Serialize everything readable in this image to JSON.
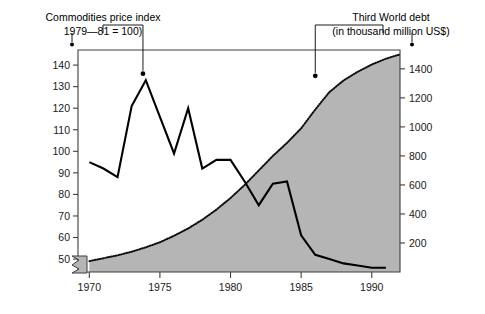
{
  "labels": {
    "left_caption_line1": "Commodities price index",
    "left_caption_line2": "1979—81 = 100)",
    "right_caption_line1": "Third World debt",
    "right_caption_line2": "(in thousand million US$)"
  },
  "chart_data": {
    "type": "line",
    "title": "",
    "xlabel": "",
    "ylabel": "Commodities price index (1979—81 = 100)",
    "y2label": "Third World debt (in thousand million US$)",
    "xlim": [
      1969.2,
      1992.0
    ],
    "ylim": [
      44,
      147
    ],
    "y2lim": [
      0,
      1530
    ],
    "grid": false,
    "legend": "none",
    "x_ticks": [
      1970,
      1975,
      1980,
      1985,
      1990
    ],
    "x_tick_labels": [
      "1970",
      "1975",
      "1980",
      "1985",
      "1990"
    ],
    "y_ticks": [
      50,
      60,
      70,
      80,
      90,
      100,
      110,
      120,
      130,
      140
    ],
    "y_tick_labels": [
      "50",
      "60",
      "70",
      "80",
      "90",
      "100",
      "110",
      "120",
      "130",
      "140"
    ],
    "y2_ticks": [
      200,
      400,
      600,
      800,
      1000,
      1200,
      1400
    ],
    "y2_tick_labels": [
      "200",
      "400",
      "600",
      "800",
      "1000",
      "1200",
      "1400"
    ],
    "axis_break_left": true,
    "series": [
      {
        "name": "Commodities price index",
        "style": "solid-line",
        "color": "#000000",
        "axis": "left",
        "x": [
          1970,
          1971,
          1972,
          1973,
          1974,
          1975,
          1976,
          1977,
          1978,
          1979,
          1980,
          1981,
          1982,
          1983,
          1984,
          1985,
          1986,
          1987,
          1988,
          1989,
          1990,
          1991
        ],
        "values": [
          95,
          92,
          88,
          121,
          133,
          116,
          99,
          120,
          92,
          96,
          96,
          86,
          75,
          85,
          86,
          61,
          52,
          50,
          48,
          47,
          46,
          46
        ]
      },
      {
        "name": "Third World debt",
        "style": "dotted-line-filled-area",
        "color": "#111111",
        "fill_color": "#b5b5b5",
        "axis": "right",
        "x": [
          1970,
          1971,
          1972,
          1973,
          1974,
          1975,
          1976,
          1977,
          1978,
          1979,
          1980,
          1981,
          1982,
          1983,
          1984,
          1985,
          1986,
          1987,
          1988,
          1989,
          1990,
          1991,
          1992
        ],
        "values": [
          75,
          95,
          115,
          140,
          170,
          205,
          250,
          300,
          360,
          430,
          510,
          600,
          700,
          800,
          890,
          990,
          1120,
          1240,
          1320,
          1380,
          1430,
          1470,
          1500
        ]
      }
    ],
    "annotations": [
      {
        "name": "commodities-leader",
        "target_x": 1973.8,
        "target_y_left": 136,
        "text_anchor": "left-caption"
      },
      {
        "name": "debt-leader",
        "target_x": 1986.0,
        "target_y_left": 135,
        "text_anchor": "right-caption"
      }
    ]
  }
}
